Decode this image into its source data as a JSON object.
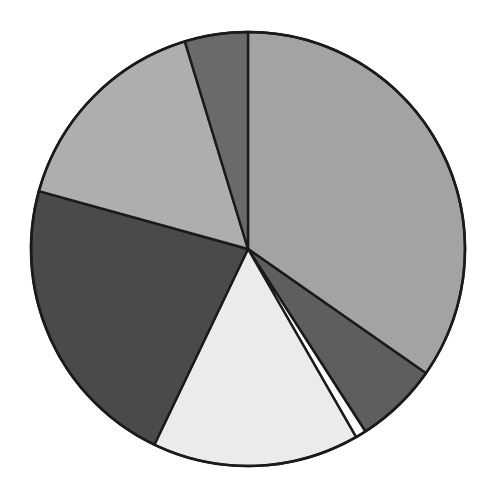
{
  "chart_data": {
    "type": "pie",
    "title": "",
    "start_angle_deg": 0,
    "direction": "clockwise",
    "legend": "none",
    "categories": [
      "Slice 1",
      "Slice 2",
      "Slice 3",
      "Slice 4",
      "Slice 5",
      "Slice 6",
      "Slice 7"
    ],
    "values": [
      34.7,
      6.2,
      0.8,
      15.4,
      22.2,
      16.0,
      4.7
    ],
    "colors": [
      "#a3a3a3",
      "#5e5e5e",
      "#ffffff",
      "#ebebeb",
      "#4a4a4a",
      "#aeaeae",
      "#6a6a6a"
    ]
  },
  "layout": {
    "cx": 248,
    "cy": 249,
    "r": 217
  }
}
